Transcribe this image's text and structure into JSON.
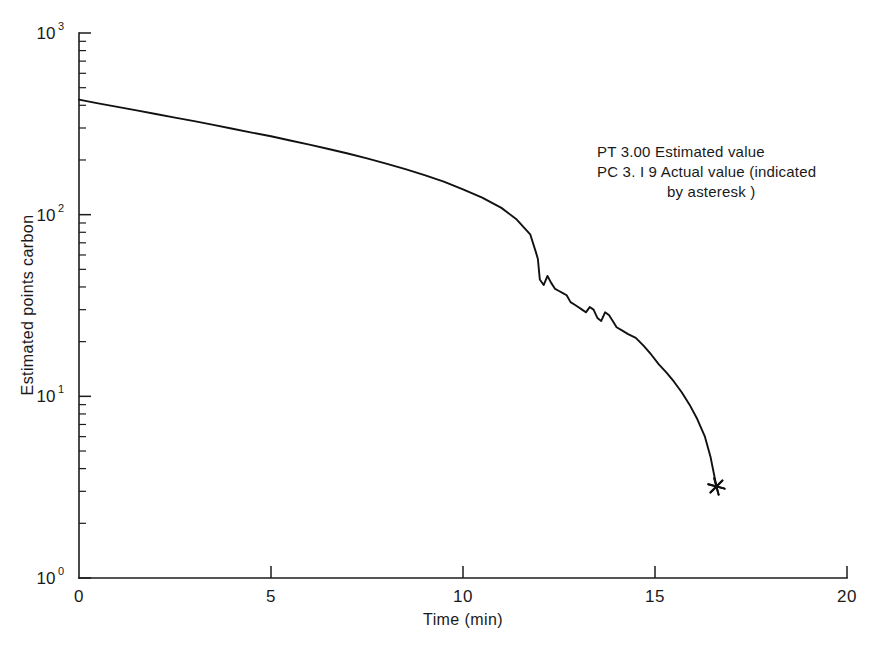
{
  "chart_data": {
    "type": "line",
    "title": "",
    "xlabel": "Time (min)",
    "ylabel": "Estimated points carbon",
    "xlim": [
      0,
      20
    ],
    "ylim": [
      1,
      1000
    ],
    "yscale": "log",
    "grid": false,
    "legend_position": "none",
    "xticks": [
      0,
      5,
      10,
      15,
      20
    ],
    "xtick_labels": [
      "0",
      "5",
      "10",
      "15",
      "20"
    ],
    "ytick_labels": [
      "10⁰",
      "10¹",
      "10²",
      "10³"
    ],
    "ytick_bases": [
      "10",
      "10",
      "10",
      "10"
    ],
    "ytick_exponents": [
      "0",
      "1",
      "2",
      "3"
    ],
    "yticks": [
      1,
      10,
      100,
      1000
    ],
    "series": [
      {
        "name": "Estimated points carbon",
        "x": [
          0.0,
          0.5,
          1.0,
          1.5,
          2.0,
          2.5,
          3.0,
          3.5,
          4.0,
          4.5,
          5.0,
          5.5,
          6.0,
          6.5,
          7.0,
          7.5,
          8.0,
          8.5,
          9.0,
          9.5,
          10.0,
          10.5,
          11.0,
          11.4,
          11.75,
          11.9,
          11.95,
          12.0,
          12.1,
          12.2,
          12.3,
          12.4,
          12.5,
          12.6,
          12.7,
          12.8,
          12.9,
          13.0,
          13.1,
          13.2,
          13.3,
          13.4,
          13.5,
          13.6,
          13.7,
          13.8,
          13.9,
          14.0,
          14.15,
          14.3,
          14.5,
          14.7,
          14.9,
          15.1,
          15.3,
          15.5,
          15.7,
          15.9,
          16.1,
          16.3,
          16.45,
          16.6
        ],
        "y": [
          430,
          410,
          392,
          375,
          358,
          342,
          327,
          312,
          297,
          283,
          270,
          256,
          243,
          230,
          217,
          204,
          191,
          178,
          165,
          152,
          138,
          124,
          109,
          94,
          78,
          62,
          57,
          44,
          41,
          46,
          42,
          39,
          38,
          37,
          36,
          33,
          32,
          31,
          30,
          29,
          31,
          30,
          27,
          26,
          29,
          28,
          26,
          24,
          23,
          22,
          21,
          19,
          17,
          15,
          13.5,
          12.0,
          10.5,
          9.0,
          7.5,
          6.0,
          4.6,
          3.19
        ]
      }
    ],
    "marker": {
      "name": "asterisk-marker",
      "symbol": "*",
      "x": 16.6,
      "y": 3.19,
      "description": "Actual value indicated by asteresk"
    }
  },
  "annotation": {
    "line1_code": "PT",
    "line1_value": "3.00",
    "line1_text": "Estimated value",
    "line2_code": "PC",
    "line2_value": "3. I 9",
    "line2_text": "Actual value (indicated",
    "line3_text": "by asteresk )",
    "line1_full": "PT  3.00 Estimated value",
    "line2_full": "PC  3. I 9 Actual value (indicated",
    "line3_full": "by asteresk )"
  },
  "colors": {
    "curve": "#111111",
    "axis": "#1c1c1c",
    "background": "#ffffff",
    "text": "#1a1a1a"
  }
}
